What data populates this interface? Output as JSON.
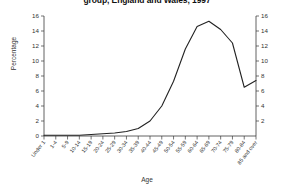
{
  "chart_data": {
    "type": "line",
    "title": "group, England and Wales, 1997",
    "xlabel": "Age",
    "ylabel": "Percentage",
    "ylabel_right": "Percentage",
    "ylim": [
      0,
      16
    ],
    "yticks": [
      0,
      2,
      4,
      6,
      8,
      10,
      12,
      14,
      16
    ],
    "ytick_labels": [
      "0",
      "2",
      "4",
      "6",
      "8",
      "10",
      "12",
      "14",
      "16"
    ],
    "right_axis": true,
    "right_yticks": [
      2,
      4,
      6,
      8,
      10,
      12,
      14,
      16
    ],
    "right_ytick_labels": [
      "2",
      "4",
      "6",
      "8",
      "10",
      "12",
      "14",
      "16"
    ],
    "grid": false,
    "legend": "none",
    "categories": [
      "Under 1",
      "1-4",
      "5-9",
      "10-14",
      "15-19",
      "20-24",
      "25-29",
      "30-34",
      "35-39",
      "40-44",
      "45-49",
      "50-54",
      "55-59",
      "60-64",
      "65-69",
      "70-74",
      "75-79",
      "80-84",
      "85 and over"
    ],
    "series": [
      {
        "name": "Percentage",
        "values": [
          0.1,
          0.1,
          0.1,
          0.1,
          0.2,
          0.3,
          0.4,
          0.6,
          1.0,
          2.0,
          4.0,
          7.3,
          11.6,
          14.6,
          15.3,
          14.2,
          12.4,
          6.5,
          7.4
        ]
      }
    ]
  }
}
